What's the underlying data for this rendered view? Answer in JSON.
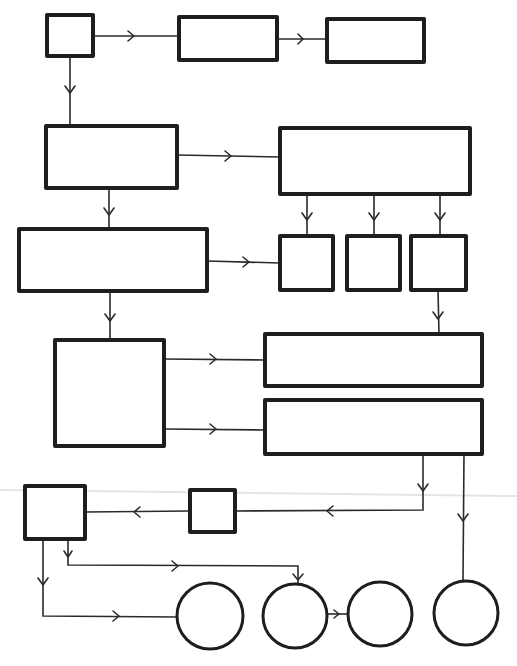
{
  "diagram": {
    "type": "flowchart",
    "style": "hand-drawn",
    "colors": {
      "stroke": "#1e1e1e",
      "background": "#ffffff",
      "fold_line": "#e4e4e4"
    },
    "nodes": [
      {
        "id": "n1",
        "shape": "rect",
        "label": "",
        "x": 47,
        "y": 15,
        "w": 46,
        "h": 41
      },
      {
        "id": "n2",
        "shape": "rect",
        "label": "",
        "x": 179,
        "y": 17,
        "w": 98,
        "h": 43
      },
      {
        "id": "n3",
        "shape": "rect",
        "label": "",
        "x": 327,
        "y": 19,
        "w": 97,
        "h": 43
      },
      {
        "id": "n4",
        "shape": "rect",
        "label": "",
        "x": 46,
        "y": 126,
        "w": 131,
        "h": 62
      },
      {
        "id": "n5",
        "shape": "rect",
        "label": "",
        "x": 280,
        "y": 128,
        "w": 190,
        "h": 66
      },
      {
        "id": "n6",
        "shape": "rect",
        "label": "",
        "x": 19,
        "y": 229,
        "w": 188,
        "h": 62
      },
      {
        "id": "n7",
        "shape": "rect",
        "label": "",
        "x": 280,
        "y": 236,
        "w": 53,
        "h": 54
      },
      {
        "id": "n8",
        "shape": "rect",
        "label": "",
        "x": 347,
        "y": 236,
        "w": 53,
        "h": 54
      },
      {
        "id": "n9",
        "shape": "rect",
        "label": "",
        "x": 411,
        "y": 236,
        "w": 55,
        "h": 54
      },
      {
        "id": "n10",
        "shape": "rect",
        "label": "",
        "x": 55,
        "y": 340,
        "w": 109,
        "h": 106
      },
      {
        "id": "n11",
        "shape": "rect",
        "label": "",
        "x": 265,
        "y": 334,
        "w": 217,
        "h": 52
      },
      {
        "id": "n12",
        "shape": "rect",
        "label": "",
        "x": 265,
        "y": 400,
        "w": 217,
        "h": 54
      },
      {
        "id": "n13",
        "shape": "rect",
        "label": "",
        "x": 25,
        "y": 486,
        "w": 60,
        "h": 53
      },
      {
        "id": "n14",
        "shape": "rect",
        "label": "",
        "x": 190,
        "y": 490,
        "w": 45,
        "h": 42
      },
      {
        "id": "n15",
        "shape": "circle",
        "label": "",
        "cx": 210,
        "cy": 616,
        "r": 33
      },
      {
        "id": "n16",
        "shape": "circle",
        "label": "",
        "cx": 295,
        "cy": 616,
        "r": 32
      },
      {
        "id": "n17",
        "shape": "circle",
        "label": "",
        "cx": 380,
        "cy": 614,
        "r": 32
      },
      {
        "id": "n18",
        "shape": "circle",
        "label": "",
        "cx": 466,
        "cy": 613,
        "r": 32
      }
    ],
    "edges": [
      {
        "from": "n1",
        "to": "n2"
      },
      {
        "from": "n2",
        "to": "n3"
      },
      {
        "from": "n1",
        "to": "n4"
      },
      {
        "from": "n4",
        "to": "n5"
      },
      {
        "from": "n4",
        "to": "n6"
      },
      {
        "from": "n5",
        "to": "n7"
      },
      {
        "from": "n5",
        "to": "n8"
      },
      {
        "from": "n5",
        "to": "n9"
      },
      {
        "from": "n6",
        "to": "n7"
      },
      {
        "from": "n6",
        "to": "n10"
      },
      {
        "from": "n9",
        "to": "n11"
      },
      {
        "from": "n10",
        "to": "n11"
      },
      {
        "from": "n10",
        "to": "n12"
      },
      {
        "from": "n12",
        "to": "n14"
      },
      {
        "from": "n12",
        "to": "n18"
      },
      {
        "from": "n14",
        "to": "n13"
      },
      {
        "from": "n13",
        "to": "n16"
      },
      {
        "from": "n13",
        "to": "n15"
      },
      {
        "from": "n16",
        "to": "n17"
      }
    ]
  }
}
